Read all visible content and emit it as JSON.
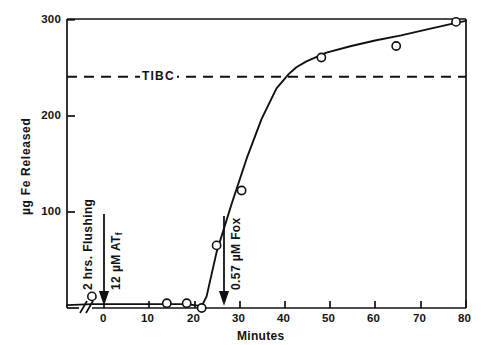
{
  "chart_data": {
    "type": "line",
    "title": "",
    "xlabel": "Minutes",
    "ylabel": "µg Fe Released",
    "xlim": [
      0,
      80
    ],
    "ylim": [
      0,
      300
    ],
    "xticks": [
      0,
      10,
      20,
      30,
      40,
      50,
      60,
      70,
      80
    ],
    "xtick_labels": [
      "0",
      "10",
      "20",
      "30",
      "40",
      "50",
      "60",
      "70",
      "80"
    ],
    "yticks": [
      100,
      200,
      300
    ],
    "ytick_labels": [
      "100",
      "200",
      "300"
    ],
    "grid": false,
    "legend": false,
    "axis_break": true,
    "axis_break_note": "broken x-axis left of 0 (2 hrs. flushing period)",
    "series": [
      {
        "name": "Fe released",
        "marker": "open-circle",
        "x": [
          5,
          20,
          24,
          27,
          30,
          35,
          51,
          66,
          78
        ],
        "y": [
          12,
          5,
          5,
          0,
          65,
          122,
          260,
          272,
          297
        ]
      }
    ],
    "fit_curve": {
      "name": "fitted curve",
      "x": [
        0,
        5,
        10,
        15,
        20,
        24,
        27,
        28,
        30,
        33,
        36,
        39,
        42,
        44.5,
        46,
        48,
        52,
        57,
        62,
        67,
        72,
        78,
        80
      ],
      "y": [
        3,
        4,
        4,
        4,
        4,
        4,
        2,
        12,
        58,
        108,
        155,
        196,
        228,
        243,
        250,
        256,
        265,
        272,
        278,
        283,
        289,
        296,
        298
      ]
    },
    "reference_lines": [
      {
        "name": "TIBC",
        "label": "TIBC",
        "orientation": "horizontal",
        "value": 240,
        "style": "dashed",
        "color": "#111111"
      }
    ],
    "annotations": [
      {
        "name": "flushing-label",
        "text": "2 hrs. Flushing",
        "orientation": "vertical",
        "x": 0,
        "has_arrow": false
      },
      {
        "name": "atf-addition",
        "text": "12 µM ATf",
        "text_main": "12 µM ATf",
        "orientation": "vertical",
        "x": 0,
        "has_arrow": true,
        "arrow_points_to_y": 0
      },
      {
        "name": "fox-addition",
        "text": "0.57 µM Fox",
        "orientation": "vertical",
        "x": 27,
        "has_arrow": true,
        "arrow_points_to_y": 0
      }
    ],
    "colors": {
      "axis": "#111111",
      "curve": "#111111",
      "marker_edge": "#111111",
      "marker_fill": "#ffffff",
      "reference_line": "#111111",
      "background": "#ffffff"
    }
  },
  "axes": {
    "x_title": "Minutes",
    "y_title": "µg Fe Released",
    "x_tick_labels": [
      "0",
      "10",
      "20",
      "30",
      "40",
      "50",
      "60",
      "70",
      "80"
    ],
    "y_tick_labels": [
      "100",
      "200",
      "300"
    ]
  },
  "annotations": {
    "tibc": "TIBC",
    "flushing": "2 hrs. Flushing",
    "atf_prefix": "12 µM AT",
    "atf_subscript": "f",
    "fox": "0.57 µM Fox"
  }
}
